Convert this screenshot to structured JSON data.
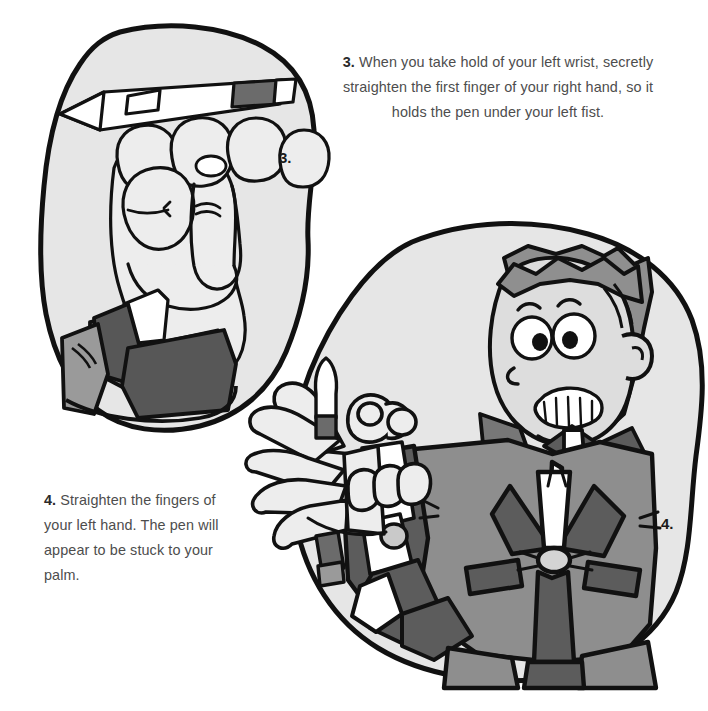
{
  "page": {
    "background_color": "#ffffff",
    "width": 708,
    "height": 711
  },
  "palette": {
    "ink": "#111111",
    "text": "#4d4d4d",
    "step_number": "#2b2b2b",
    "blob_fill": "#e6e6e6",
    "skin": "#ededed",
    "skin_shadow": "#d9d9d9",
    "face": "#dddddd",
    "hair": "#8f8f8f",
    "jacket": "#8e8e8e",
    "jacket_dark": "#5c5c5c",
    "sleeve_dark": "#575757",
    "sleeve_mid": "#9a9a9a",
    "shirt_white": "#ffffff",
    "pen_barrel": "#ffffff",
    "pen_grip": "#6b6b6b",
    "button": "#c9c9c9"
  },
  "instructions": [
    {
      "id": "instruction-3",
      "number": "3.",
      "lines": [
        "When you take hold of your left wrist, secretly",
        "straighten the first finger of your right hand, so it",
        "holds the pen under your left fist."
      ],
      "full_text": "When you take hold of your left wrist, secretly straighten the first finger of your right hand, so it holds the pen under your left fist."
    },
    {
      "id": "instruction-4",
      "number": "4.",
      "lines": [
        "Straighten the fingers of",
        "your left hand. The pen will",
        "appear to be stuck to your",
        "palm."
      ],
      "full_text": "Straighten the fingers of your left hand. The pen will appear to be stuck to your palm."
    }
  ],
  "figures": [
    {
      "id": "figure-3",
      "label": "3.",
      "caption_ref": "instruction-3",
      "description": "A clenched fist seen from the knuckle side holding a pen across the fingers, with a shirt cuff and dark jacket sleeve at the wrist"
    },
    {
      "id": "figure-4",
      "label": "4.",
      "caption_ref": "instruction-4",
      "description": "A grinning boy in a jacket and bow tie holding out his open left hand with a pen apparently stuck to the palm"
    }
  ],
  "folio": ""
}
